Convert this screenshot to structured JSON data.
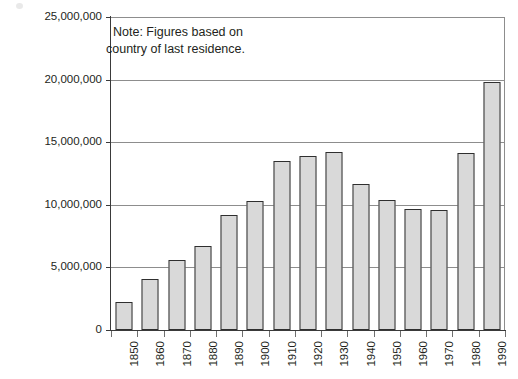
{
  "chart_data": {
    "type": "bar",
    "title": "",
    "subtitle": "",
    "xlabel": "",
    "ylabel": "",
    "categories": [
      "1850",
      "1860",
      "1870",
      "1880",
      "1890",
      "1900",
      "1910",
      "1920",
      "1930",
      "1940",
      "1950",
      "1960",
      "1970",
      "1980",
      "1990"
    ],
    "values": [
      2200000,
      4100000,
      5600000,
      6700000,
      9200000,
      10300000,
      13500000,
      13900000,
      14200000,
      11700000,
      10400000,
      9700000,
      9600000,
      14100000,
      19800000
    ],
    "ylim": [
      0,
      25000000
    ],
    "y_ticks": [
      0,
      5000000,
      10000000,
      15000000,
      20000000,
      25000000
    ],
    "y_tick_labels": [
      "0",
      "5,000,000",
      "10,000,000",
      "15,000,000",
      "20,000,000",
      "25,000,000"
    ],
    "grid": true,
    "grid_axis": "y",
    "legend": false,
    "legend_position": "none",
    "bar_fill_color": "#d9d9d9",
    "bar_edge_color": "#2f2f2f",
    "axis_color": "#3a3a3a",
    "grid_color": "#8d8d8d",
    "text_color": "#231f20",
    "x_tick_label_rotation": 90,
    "annotations": [
      {
        "name": "note",
        "line_1": "Note: Figures based on",
        "line_2": "country of last residence."
      }
    ]
  }
}
